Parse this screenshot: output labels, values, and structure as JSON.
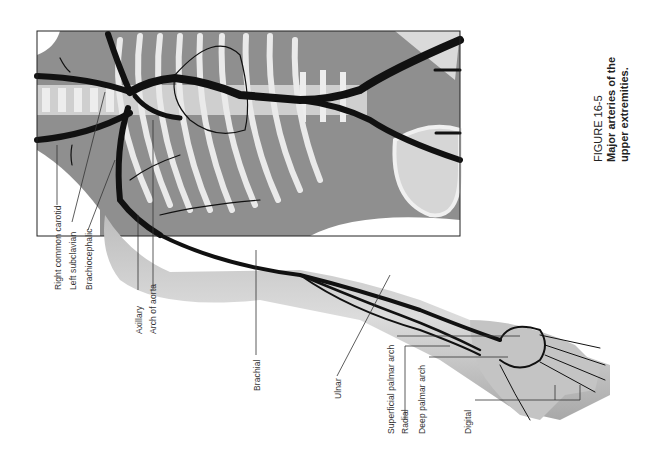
{
  "figure": {
    "number": "FIGURE 16-5",
    "caption_line1": "Major arteries of the",
    "caption_line2": "upper extremities.",
    "illustration": "Anatomical drawing of arteries of the upper extremity over skeleton (rotated 90°)"
  },
  "labels": [
    {
      "id": "right-common-carotid",
      "text": "Right common carotid"
    },
    {
      "id": "left-subclavian",
      "text": "Left subclavian"
    },
    {
      "id": "brachiocephalic",
      "text": "Brachiocephalic"
    },
    {
      "id": "axillary",
      "text": "Axillary"
    },
    {
      "id": "arch-of-aorta",
      "text": "Arch of aorta"
    },
    {
      "id": "brachial",
      "text": "Brachial"
    },
    {
      "id": "ulnar",
      "text": "Ulnar"
    },
    {
      "id": "superficial-palmar-arch",
      "text": "Superficial palmar arch"
    },
    {
      "id": "radial",
      "text": "Radial"
    },
    {
      "id": "deep-palmar-arch",
      "text": "Deep palmar arch"
    },
    {
      "id": "digital",
      "text": "Digital"
    }
  ],
  "colors": {
    "artery": "#111111",
    "tissue": "#9a9a9a",
    "bone": "#e6e6e6",
    "background": "#ffffff"
  }
}
